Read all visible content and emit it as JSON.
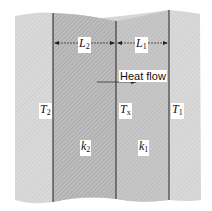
{
  "diagram": {
    "regions": [
      {
        "id": "outer-left",
        "fill": "#d6d6d6"
      },
      {
        "id": "slab-2",
        "fill": "#b4b4b4",
        "conductivity_label": "k",
        "conductivity_sub": "2",
        "thickness_label": "L",
        "thickness_sub": "2"
      },
      {
        "id": "slab-1",
        "fill": "#c2c2c2",
        "conductivity_label": "k",
        "conductivity_sub": "1",
        "thickness_label": "L",
        "thickness_sub": "1"
      },
      {
        "id": "outer-right",
        "fill": "#d6d6d6"
      }
    ],
    "labels": {
      "L2": {
        "main": "L",
        "sub": "2"
      },
      "L1": {
        "main": "L",
        "sub": "1"
      },
      "T2": {
        "main": "T",
        "sub": "2"
      },
      "Tx": {
        "main": "T",
        "sub": "x"
      },
      "T1": {
        "main": "T",
        "sub": "1"
      },
      "k2": {
        "main": "k",
        "sub": "2"
      },
      "k1": {
        "main": "k",
        "sub": "1"
      },
      "heat_flow": "Heat flow"
    },
    "colors": {
      "outer": "#d6d6d6",
      "slab2": "#b4b4b4",
      "slab1": "#c2c2c2",
      "line": "#222222"
    }
  }
}
